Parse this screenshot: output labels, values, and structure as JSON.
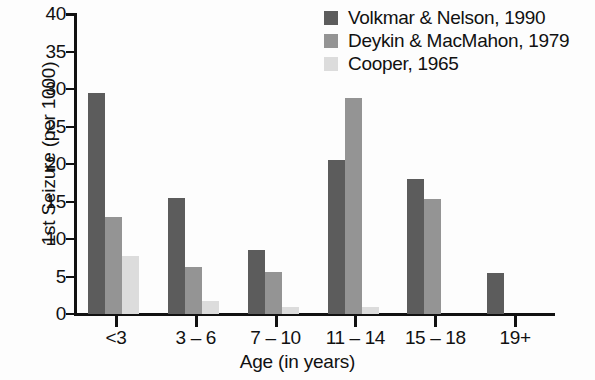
{
  "chart_data": {
    "type": "bar",
    "title": "",
    "xlabel": "Age (in years)",
    "ylabel": "1st Seizure (per 1000)",
    "categories": [
      "<3",
      "3 – 6",
      "7 – 10",
      "11 – 14",
      "15 – 18",
      "19+"
    ],
    "series": [
      {
        "name": "Volkmar & Nelson, 1990",
        "color": "#5c5c5c",
        "values": [
          29.5,
          15.5,
          8.5,
          20.6,
          18.0,
          5.5
        ]
      },
      {
        "name": "Deykin & MacMahon, 1979",
        "color": "#949494",
        "values": [
          12.9,
          6.3,
          5.6,
          28.8,
          15.4,
          0
        ]
      },
      {
        "name": "Cooper, 1965",
        "color": "#dcdcdc",
        "values": [
          7.7,
          1.8,
          1.0,
          1.0,
          0,
          0
        ]
      }
    ],
    "ylim": [
      0,
      40
    ],
    "yticks": [
      0,
      5,
      10,
      15,
      20,
      25,
      30,
      35,
      40
    ],
    "ytick_labels": [
      "0",
      "5",
      "10",
      "15",
      "20",
      "25",
      "30",
      "35",
      "40"
    ],
    "grid": false,
    "legend_position": "top-right"
  },
  "legend": {
    "entries": [
      {
        "label": "Volkmar & Nelson, 1990"
      },
      {
        "label": "Deykin & MacMahon, 1979"
      },
      {
        "label": "Cooper, 1965"
      }
    ]
  }
}
